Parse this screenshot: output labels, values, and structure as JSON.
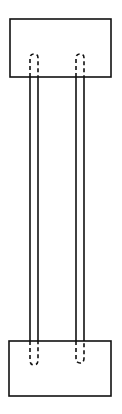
{
  "diagram": {
    "colors": {
      "stroke": "#111111",
      "background": "#ffffff"
    },
    "top_block": {
      "x": 10,
      "y": 19,
      "w": 101,
      "h": 58
    },
    "bottom_block": {
      "x": 9,
      "y": 341,
      "w": 102,
      "h": 55
    },
    "rods": [
      {
        "name": "left-rod",
        "x1": 30,
        "x2": 38
      },
      {
        "name": "right-rod",
        "x1": 76,
        "x2": 84
      }
    ]
  }
}
